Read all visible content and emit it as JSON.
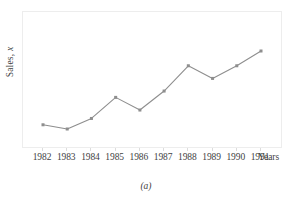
{
  "figure": {
    "caption": "(a)",
    "background_color": "#ffffff"
  },
  "axes": {
    "y_title_prefix": "Sales, ",
    "y_title_variable": "x",
    "x_axis_name": "Years",
    "frame_color": "#ededed",
    "tick_color": "#dcdcdc",
    "label_color": "#3f3f3f"
  },
  "chart_data": {
    "type": "line",
    "title": "",
    "subtitle": "",
    "xlabel": "Years",
    "ylabel": "Sales, x",
    "categories": [
      "1982",
      "1983",
      "1984",
      "1985",
      "1986",
      "1987",
      "1988",
      "1989",
      "1990",
      "1991"
    ],
    "values": [
      29,
      27,
      32,
      42,
      36,
      45,
      57,
      51,
      57,
      64
    ],
    "ylim": [
      0,
      100
    ],
    "xlim": [
      "1982",
      "1991"
    ],
    "grid": false,
    "legend": null,
    "series": [
      {
        "name": "Sales",
        "values": [
          29,
          27,
          32,
          42,
          36,
          45,
          57,
          51,
          57,
          64
        ],
        "line_color": "#8e8e8e",
        "marker": "square",
        "marker_color": "#8e8e8e",
        "marker_size": 3
      }
    ],
    "annotations": [],
    "y_axis_ticks_shown": false,
    "x_axis_ticks_shown": true
  },
  "xticks": {
    "labels": [
      "1982",
      "1983",
      "1984",
      "1985",
      "1986",
      "1987",
      "1988",
      "1989",
      "1990",
      "1991"
    ],
    "axis_name": "Years"
  }
}
